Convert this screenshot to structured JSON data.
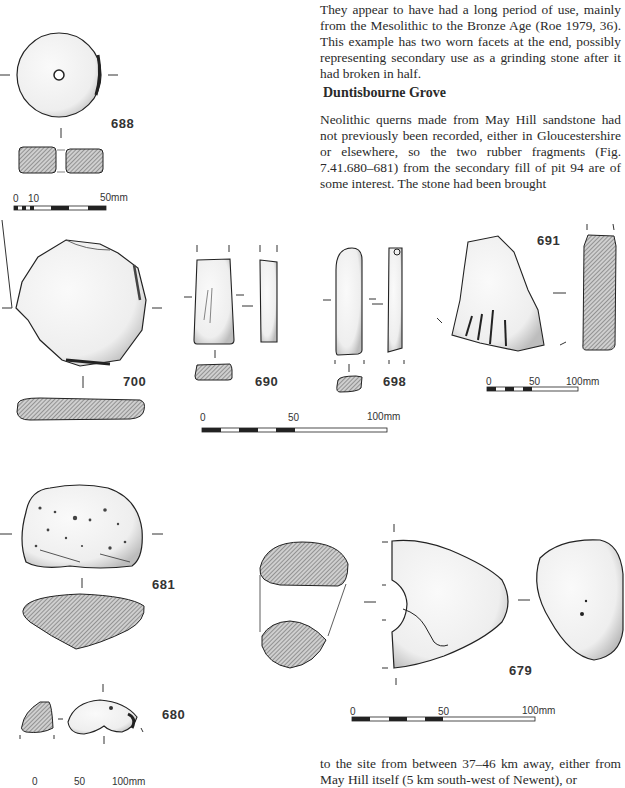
{
  "text": {
    "para_top": "They appear to have had a long period of use, mainly from the Mesolithic to the Bronze Age (Roe 1979, 36). This example has two worn facets at the end, possibly representing secondary use as a grinding stone after it had broken in half.",
    "heading": "Duntisbourne Grove",
    "para_middle": "Neolithic querns made from May Hill sandstone had not previously been recorded, either in Gloucestershire or elsewhere, so the two rubber fragments (Fig. 7.41.680–681) from the secondary fill of pit 94 are of some interest. The stone had been brought",
    "para_bottom": "to the site from between 37–46 km away, either from May Hill itself (5 km south-west of Newent), or"
  },
  "figures": {
    "f688": {
      "label": "688"
    },
    "f700": {
      "label": "700"
    },
    "f690": {
      "label": "690"
    },
    "f698": {
      "label": "698"
    },
    "f691": {
      "label": "691"
    },
    "f681": {
      "label": "681"
    },
    "f680": {
      "label": "680"
    },
    "f679": {
      "label": "679"
    }
  },
  "scales": {
    "s1": {
      "t0": "0",
      "t1": "10",
      "t2": "50mm"
    },
    "s2": {
      "t0": "0",
      "t1": "50",
      "t2": "100mm"
    },
    "s3": {
      "t0": "0",
      "t1": "50",
      "t2": "100mm"
    },
    "s4": {
      "t0": "0",
      "t1": "50",
      "t2": "100mm"
    },
    "s5": {
      "t0": "0",
      "t1": "50",
      "t2": "100mm"
    }
  },
  "colors": {
    "ink": "#222222",
    "hatch": "#9a9a9a",
    "paper": "#ffffff"
  }
}
